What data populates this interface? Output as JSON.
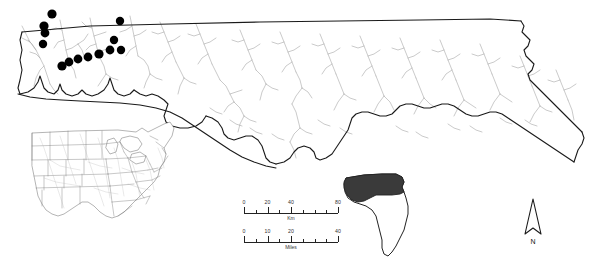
{
  "figure": {
    "type": "distribution-map",
    "region": "Florida Panhandle and North Florida"
  },
  "main_map": {
    "name": "north-florida-map",
    "outline_color": "#1a1a1a",
    "river_color": "#9a9a9a",
    "point_color": "#000000",
    "background_color": "#ffffff"
  },
  "points": {
    "label": "sampling-localities",
    "count": 13,
    "marker": "filled-circle",
    "color": "#000000",
    "coords": [
      {
        "id": 1,
        "x": 52,
        "y": 14,
        "r": 4.6
      },
      {
        "id": 2,
        "x": 44,
        "y": 26,
        "r": 4.6
      },
      {
        "id": 3,
        "x": 45,
        "y": 33,
        "r": 4.4
      },
      {
        "id": 4,
        "x": 43,
        "y": 44,
        "r": 4.2
      },
      {
        "id": 5,
        "x": 120,
        "y": 21,
        "r": 4.2
      },
      {
        "id": 6,
        "x": 114,
        "y": 40,
        "r": 4.2
      },
      {
        "id": 7,
        "x": 110,
        "y": 50,
        "r": 4.4
      },
      {
        "id": 8,
        "x": 121,
        "y": 50,
        "r": 4.2
      },
      {
        "id": 9,
        "x": 99,
        "y": 54,
        "r": 4.6
      },
      {
        "id": 10,
        "x": 88,
        "y": 57,
        "r": 4.4
      },
      {
        "id": 11,
        "x": 78,
        "y": 59,
        "r": 4.4
      },
      {
        "id": 12,
        "x": 69,
        "y": 62,
        "r": 4.4
      },
      {
        "id": 13,
        "x": 62,
        "y": 66,
        "r": 4.6
      }
    ]
  },
  "us_inset": {
    "name": "united-states-locator-inset",
    "description": "Outline map of the central and eastern United States with state boundaries and rivers",
    "outline_color": "#555555",
    "fill_color": "#ffffff"
  },
  "florida_inset": {
    "name": "florida-locator-inset",
    "description": "Outline of the state of Florida with the northern panhandle study area shaded dark",
    "outline_color": "#222222",
    "highlight_color": "#3a3a3a",
    "fill_color": "#ffffff"
  },
  "scale_km": {
    "name": "kilometer-scale-bar",
    "unit": "Km",
    "labels": [
      "0",
      "20",
      "40",
      "80"
    ],
    "label_positions": [
      0,
      25,
      50,
      100
    ],
    "tick_positions": [
      0,
      12.5,
      25,
      37.5,
      50,
      62.5,
      75,
      87.5,
      100
    ],
    "major_ticks": [
      0,
      25,
      50,
      100
    ]
  },
  "scale_miles": {
    "name": "mile-scale-bar",
    "unit": "Miles",
    "labels": [
      "0",
      "10",
      "20",
      "40"
    ],
    "label_positions": [
      0,
      25,
      50,
      100
    ],
    "tick_positions": [
      0,
      12.5,
      25,
      37.5,
      50,
      62.5,
      75,
      87.5,
      100
    ],
    "major_ticks": [
      0,
      25,
      50,
      100
    ]
  },
  "north_arrow": {
    "name": "north-arrow",
    "label": "N"
  }
}
